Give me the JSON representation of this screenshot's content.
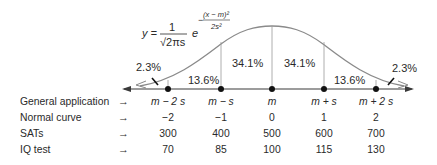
{
  "formula": {
    "lhs": "y =",
    "numerator": "1",
    "denominator": "√2πs",
    "base": "e",
    "exponent_sign": "−",
    "exponent_numerator": "(x − m)²",
    "exponent_denominator": "2s²"
  },
  "regions": [
    {
      "label": "2.3%",
      "position": "left-tail"
    },
    {
      "label": "13.6%",
      "position": "m-2s to m-s"
    },
    {
      "label": "34.1%",
      "position": "m-s to m"
    },
    {
      "label": "34.1%",
      "position": "m to m+s"
    },
    {
      "label": "13.6%",
      "position": "m+s to m+2s"
    },
    {
      "label": "2.3%",
      "position": "right-tail"
    }
  ],
  "table": {
    "arrow": "→",
    "rows": [
      {
        "label": "General application",
        "values": [
          "m − 2 s",
          "m − s",
          "m",
          "m + s",
          "m + 2 s"
        ],
        "italic": true
      },
      {
        "label": "Normal curve",
        "values": [
          "−2",
          "−1",
          "0",
          "1",
          "2"
        ]
      },
      {
        "label": "SATs",
        "values": [
          "300",
          "400",
          "500",
          "600",
          "700"
        ]
      },
      {
        "label": "IQ test",
        "values": [
          "70",
          "85",
          "100",
          "115",
          "130"
        ]
      }
    ]
  },
  "colors": {
    "curve": "#8a8a8a",
    "axis": "#3a3a3a",
    "text": "#2a2a2a",
    "dot": "#111111"
  }
}
